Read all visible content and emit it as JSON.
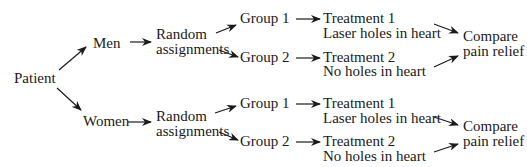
{
  "diagram": {
    "root": "Patient",
    "branches": [
      {
        "label": "Men",
        "assignment": [
          "Random",
          "assignments"
        ],
        "groups": [
          {
            "label": "Group 1",
            "treatment": "Treatment 1",
            "detail": "Laser holes in heart"
          },
          {
            "label": "Group 2",
            "treatment": "Treatment 2",
            "detail": "No holes in heart"
          }
        ],
        "outcome": [
          "Compare",
          "pain relief"
        ]
      },
      {
        "label": "Women",
        "assignment": [
          "Random",
          "assignments"
        ],
        "groups": [
          {
            "label": "Group 1",
            "treatment": "Treatment 1",
            "detail": "Laser holes in heart"
          },
          {
            "label": "Group 2",
            "treatment": "Treatment 2",
            "detail": "No holes in heart"
          }
        ],
        "outcome": [
          "Compare",
          "pain relief"
        ]
      }
    ]
  }
}
